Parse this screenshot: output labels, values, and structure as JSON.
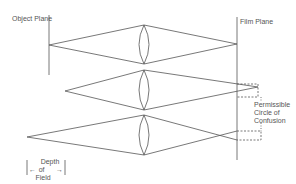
{
  "labels": {
    "object_plane": "Object Plane",
    "film_plane": "Film Plane",
    "coc_line1": "Permissible",
    "coc_line2": "Circle of",
    "coc_line3": "Confusion",
    "dof_line1": "Depth",
    "dof_line2": "of",
    "dof_line3": "Field",
    "dof_arrow_left": "←",
    "dof_arrow_right": "→"
  },
  "colors": {
    "line": "#555555",
    "text": "#555555",
    "background": "#ffffff"
  }
}
